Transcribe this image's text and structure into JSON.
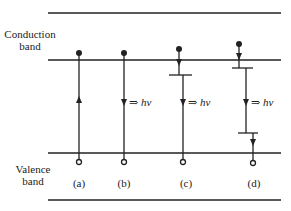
{
  "diagram": {
    "conduction_band_label": [
      "Conduction",
      "band"
    ],
    "valence_band_label": [
      "Valence",
      "band"
    ],
    "photon_symbol": "hν",
    "emission_arrow": "⇒",
    "cases": [
      {
        "id": "a",
        "label": "(a)",
        "process": "upward transition (absorption)",
        "emits_photon": false
      },
      {
        "id": "b",
        "label": "(b)",
        "process": "direct band-to-band recombination",
        "emits_photon": true
      },
      {
        "id": "c",
        "label": "(c)",
        "process": "electron trapped near conduction band, then recombination",
        "emits_photon": true
      },
      {
        "id": "d",
        "label": "(d)",
        "process": "two-level trap recombination",
        "emits_photon": true
      }
    ],
    "colors": {
      "line": "#222222",
      "background": "#ffffff"
    }
  }
}
